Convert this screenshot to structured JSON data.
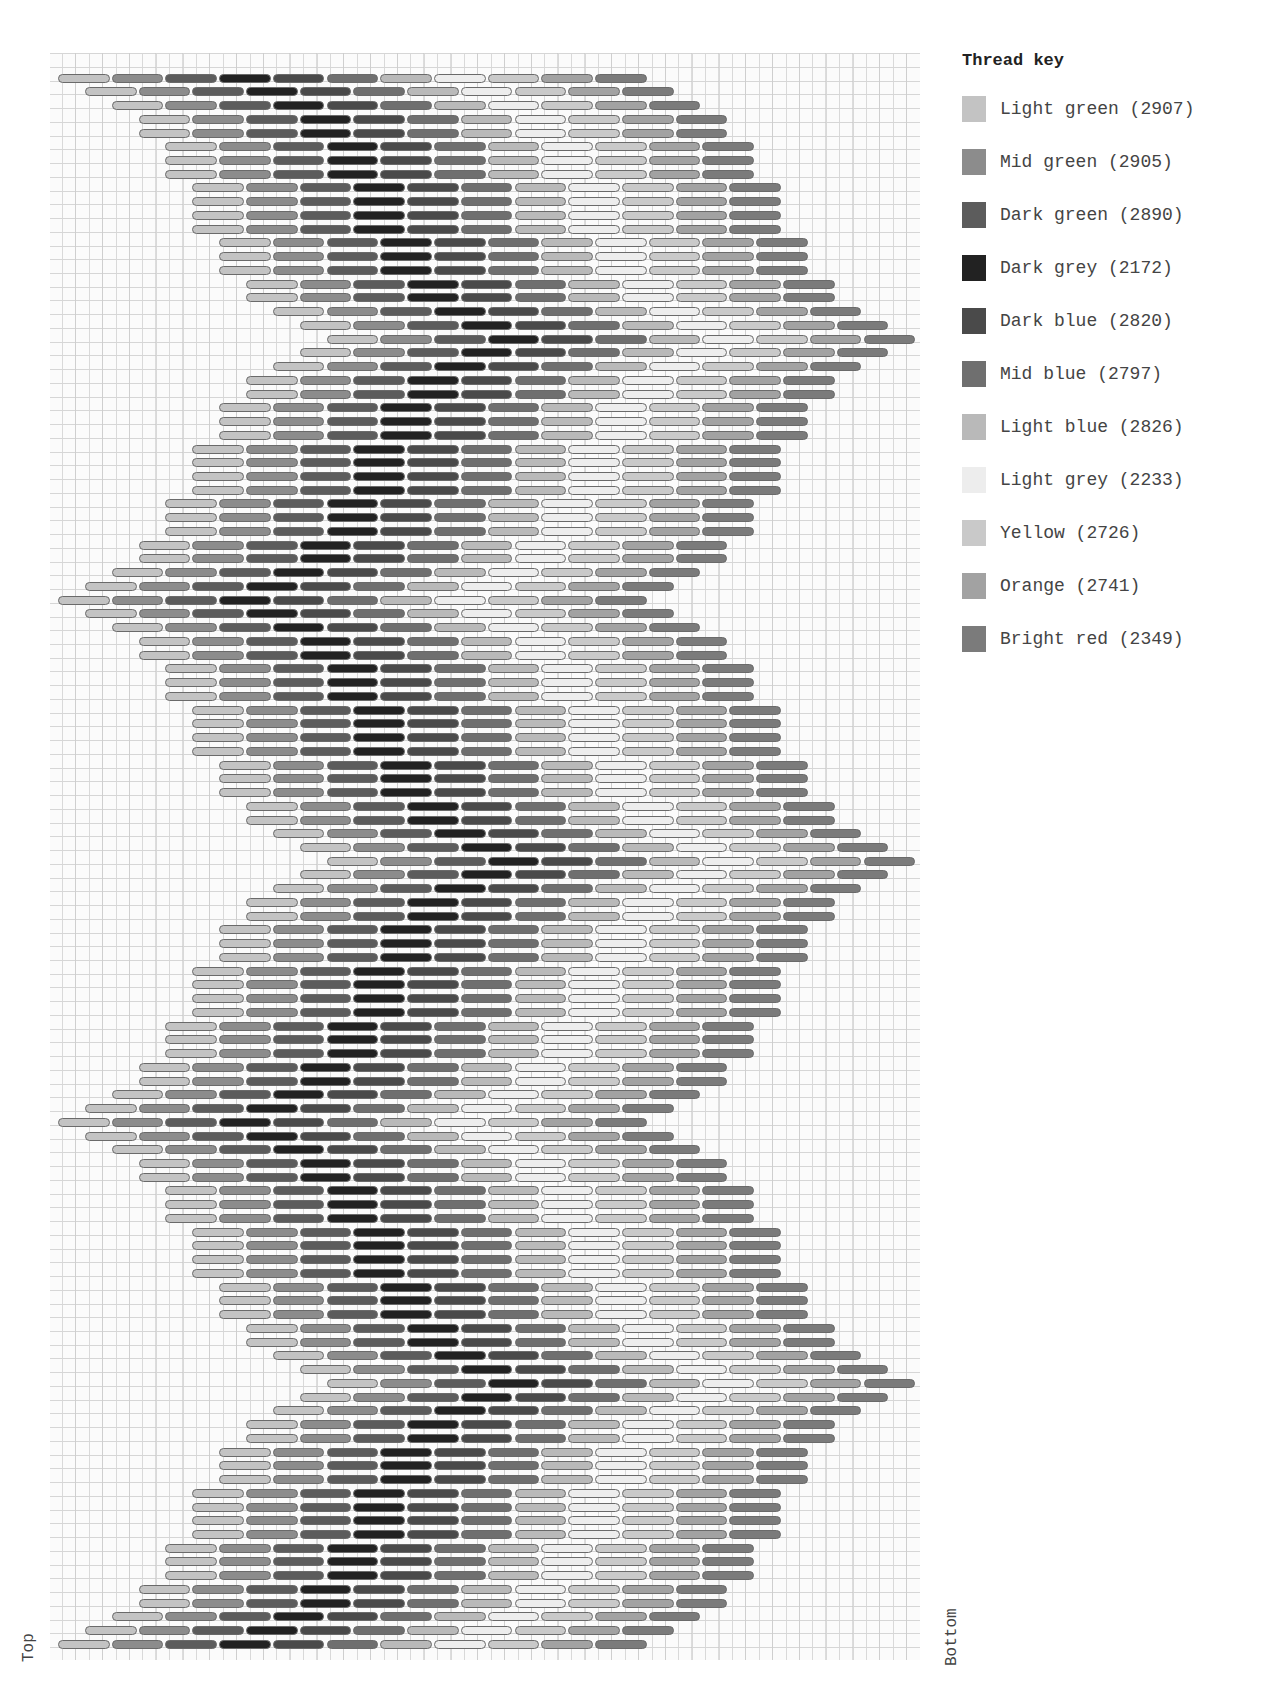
{
  "legend": {
    "title": "Thread key",
    "items": [
      {
        "name": "Light green",
        "code": "2907",
        "label": "Light green (2907)",
        "color": "#c3c3c3"
      },
      {
        "name": "Mid green",
        "code": "2905",
        "label": "Mid green (2905)",
        "color": "#8c8c8c"
      },
      {
        "name": "Dark green",
        "code": "2890",
        "label": "Dark green (2890)",
        "color": "#5c5c5c"
      },
      {
        "name": "Dark grey",
        "code": "2172",
        "label": "Dark grey (2172)",
        "color": "#222222"
      },
      {
        "name": "Dark blue",
        "code": "2820",
        "label": "Dark blue (2820)",
        "color": "#4a4a4a"
      },
      {
        "name": "Mid blue",
        "code": "2797",
        "label": "Mid blue (2797)",
        "color": "#6f6f6f"
      },
      {
        "name": "Light blue",
        "code": "2826",
        "label": "Light blue (2826)",
        "color": "#b9b9b9"
      },
      {
        "name": "Light grey",
        "code": "2233",
        "label": "Light grey (2233)",
        "color": "#ededed"
      },
      {
        "name": "Yellow",
        "code": "2726",
        "label": "Yellow (2726)",
        "color": "#c9c9c9"
      },
      {
        "name": "Orange",
        "code": "2741",
        "label": "Orange (2741)",
        "color": "#a2a2a2"
      },
      {
        "name": "Bright red",
        "code": "2349",
        "label": "Bright red (2349)",
        "color": "#7b7b7b"
      }
    ]
  },
  "axis": {
    "left_label": "Top",
    "right_label": "Bottom"
  },
  "pattern": {
    "type": "bargello stitch chart",
    "stitches_per_row": 11,
    "stitch_span_units": 2,
    "row_count": 115,
    "wave_offsets": [
      0,
      1,
      2,
      3,
      3,
      4,
      4,
      4,
      5,
      5,
      5,
      5,
      6,
      6,
      6,
      7,
      7,
      8,
      9,
      10,
      9,
      8,
      7,
      7,
      6,
      6,
      6,
      5,
      5,
      5,
      5,
      4,
      4,
      4,
      3,
      3,
      2,
      1
    ],
    "repeats": 3,
    "color_order": [
      "Light green",
      "Mid green",
      "Dark green",
      "Dark grey",
      "Dark blue",
      "Mid blue",
      "Light blue",
      "Light grey",
      "Yellow",
      "Orange",
      "Bright red"
    ]
  }
}
